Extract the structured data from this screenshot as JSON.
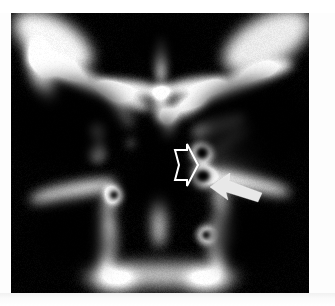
{
  "figure": {
    "modality": "CT",
    "plane": "coronal",
    "region": "paranasal sinuses and skull base",
    "background_color": "#ffffff",
    "image_background_color": "#000000",
    "bone_color": "#ffffff",
    "annotation_color": "#ffffff",
    "frame": {
      "x": 11,
      "y": 13,
      "width": 298,
      "height": 280
    }
  },
  "annotations": [
    {
      "id": "open-arrow",
      "type": "open-arrow",
      "style": "hollow white outline",
      "direction": "right",
      "color": "#ffffff",
      "outline_width": 2,
      "x": 152,
      "y": 131,
      "width": 35,
      "height": 42,
      "points": "12,6 24,6 24,0 35,21 24,42 24,36 12,36 16,21"
    },
    {
      "id": "solid-arrow",
      "type": "solid-arrow",
      "style": "filled white block arrow",
      "direction": "upper-left",
      "color": "#e8e8e8",
      "x": 199,
      "y": 158,
      "width": 54,
      "height": 31,
      "points": "0,16 20,2 19,10 52,22 48,31 16,21 18,29"
    }
  ],
  "anatomy": {
    "structures": [
      {
        "name": "left-orbital-roof",
        "label": "orbital roof (left)"
      },
      {
        "name": "right-orbital-roof",
        "label": "orbital roof (right)"
      },
      {
        "name": "crista-galli",
        "label": "midline crest / nasal septum superior"
      },
      {
        "name": "ethmoid-air-cells",
        "label": "ethmoid air cells"
      },
      {
        "name": "sphenoid-sinus",
        "label": "sphenoid sinus"
      },
      {
        "name": "pterygoid-plates",
        "label": "pterygoid plates"
      },
      {
        "name": "hard-palate",
        "label": "hard palate / maxillary alveolus"
      },
      {
        "name": "foramen-rotundum-ring",
        "label": "small cortical ring (foramen)"
      },
      {
        "name": "figure-eight-ossicle",
        "label": "paired ring opacity lateral to midline"
      }
    ]
  },
  "chart_data": {
    "type": "heatmap",
    "title": "",
    "xlabel": "",
    "ylabel": "",
    "window": "bone",
    "grid": false,
    "legend": "none",
    "blobs": [
      {
        "name": "left-frontal-orbital-bone",
        "cx": 42,
        "cy": 28,
        "rx": 44,
        "ry": 22,
        "rot": 32,
        "intensity": 0.97,
        "blur": 7
      },
      {
        "name": "left-orbital-rim-bar",
        "cx": 78,
        "cy": 70,
        "rx": 66,
        "ry": 9,
        "rot": 23,
        "intensity": 1.0,
        "blur": 5
      },
      {
        "name": "left-orbital-roof-ridge",
        "cx": 30,
        "cy": 60,
        "rx": 30,
        "ry": 10,
        "rot": 70,
        "intensity": 0.95,
        "blur": 6
      },
      {
        "name": "right-frontal-orbital-bone",
        "cx": 256,
        "cy": 28,
        "rx": 48,
        "ry": 24,
        "rot": -30,
        "intensity": 0.92,
        "blur": 7
      },
      {
        "name": "right-orbital-rim-bar",
        "cx": 222,
        "cy": 72,
        "rx": 64,
        "ry": 9,
        "rot": -20,
        "intensity": 1.0,
        "blur": 5
      },
      {
        "name": "crista-galli-spike",
        "cx": 150,
        "cy": 48,
        "rx": 5,
        "ry": 22,
        "rot": 0,
        "intensity": 1.0,
        "blur": 4
      },
      {
        "name": "cribriform-plate-left",
        "cx": 122,
        "cy": 75,
        "rx": 34,
        "ry": 7,
        "rot": 8,
        "intensity": 0.98,
        "blur": 4
      },
      {
        "name": "cribriform-plate-right",
        "cx": 180,
        "cy": 73,
        "rx": 34,
        "ry": 7,
        "rot": -10,
        "intensity": 0.98,
        "blur": 4
      },
      {
        "name": "nasal-septum-upper",
        "cx": 150,
        "cy": 92,
        "rx": 7,
        "ry": 18,
        "rot": 0,
        "intensity": 0.9,
        "blur": 5
      },
      {
        "name": "ethmoid-strand-left",
        "cx": 108,
        "cy": 96,
        "rx": 22,
        "ry": 5,
        "rot": 55,
        "intensity": 0.7,
        "blur": 6
      },
      {
        "name": "ethmoid-dot-a",
        "cx": 86,
        "cy": 118,
        "rx": 7,
        "ry": 8,
        "rot": 0,
        "intensity": 0.95,
        "blur": 4
      },
      {
        "name": "ethmoid-dot-b",
        "cx": 86,
        "cy": 140,
        "rx": 8,
        "ry": 9,
        "rot": 0,
        "intensity": 0.9,
        "blur": 4
      },
      {
        "name": "ethmoid-dot-c",
        "cx": 88,
        "cy": 129,
        "rx": 4,
        "ry": 8,
        "rot": 0,
        "intensity": 0.55,
        "blur": 4
      },
      {
        "name": "small-dot-left",
        "cx": 120,
        "cy": 130,
        "rx": 4,
        "ry": 4,
        "rot": 0,
        "intensity": 0.6,
        "blur": 4
      },
      {
        "name": "sphenoid-midline-strut",
        "cx": 158,
        "cy": 110,
        "rx": 6,
        "ry": 16,
        "rot": 10,
        "intensity": 0.8,
        "blur": 5
      },
      {
        "name": "planum-sphenoidale",
        "cx": 172,
        "cy": 98,
        "rx": 26,
        "ry": 6,
        "rot": -22,
        "intensity": 0.85,
        "blur": 5
      },
      {
        "name": "ring-eight-upper",
        "cx": 191,
        "cy": 140,
        "rx": 12,
        "ry": 11,
        "rot": 0,
        "intensity": 0.95,
        "blur": 3,
        "hollow": true,
        "hole_rx": 6,
        "hole_ry": 6
      },
      {
        "name": "ring-eight-lower",
        "cx": 192,
        "cy": 163,
        "rx": 13,
        "ry": 12,
        "rot": 0,
        "intensity": 0.95,
        "blur": 3,
        "hollow": true,
        "hole_rx": 7,
        "hole_ry": 6
      },
      {
        "name": "lateral-bar-right",
        "cx": 208,
        "cy": 112,
        "rx": 28,
        "ry": 7,
        "rot": -18,
        "intensity": 0.88,
        "blur": 5
      },
      {
        "name": "lateral-bar-right-2",
        "cx": 222,
        "cy": 124,
        "rx": 18,
        "ry": 6,
        "rot": -35,
        "intensity": 0.7,
        "blur": 6
      },
      {
        "name": "soft-haze-right",
        "cx": 214,
        "cy": 150,
        "rx": 26,
        "ry": 26,
        "rot": 0,
        "intensity": 0.3,
        "blur": 14
      },
      {
        "name": "pterygoid-left-arc",
        "cx": 62,
        "cy": 178,
        "rx": 44,
        "ry": 8,
        "rot": -12,
        "intensity": 0.9,
        "blur": 6
      },
      {
        "name": "pterygoid-left-vert",
        "cx": 96,
        "cy": 200,
        "rx": 7,
        "ry": 30,
        "rot": 12,
        "intensity": 0.75,
        "blur": 6
      },
      {
        "name": "foramen-ring-left",
        "cx": 103,
        "cy": 182,
        "rx": 9,
        "ry": 9,
        "rot": 0,
        "intensity": 0.95,
        "blur": 3,
        "hollow": true,
        "hole_rx": 4,
        "hole_ry": 4
      },
      {
        "name": "pterygoid-right-arc",
        "cx": 238,
        "cy": 170,
        "rx": 42,
        "ry": 8,
        "rot": 14,
        "intensity": 0.9,
        "blur": 6
      },
      {
        "name": "pterygoid-right-vert",
        "cx": 212,
        "cy": 200,
        "rx": 7,
        "ry": 32,
        "rot": -10,
        "intensity": 0.75,
        "blur": 6
      },
      {
        "name": "foramen-ring-right",
        "cx": 195,
        "cy": 222,
        "rx": 9,
        "ry": 9,
        "rot": 0,
        "intensity": 0.95,
        "blur": 3,
        "hollow": true,
        "hole_rx": 4,
        "hole_ry": 4
      },
      {
        "name": "vomer-midline",
        "cx": 148,
        "cy": 208,
        "rx": 7,
        "ry": 26,
        "rot": 0,
        "intensity": 0.78,
        "blur": 6
      },
      {
        "name": "maxilla-left-wall",
        "cx": 96,
        "cy": 232,
        "rx": 9,
        "ry": 26,
        "rot": 6,
        "intensity": 0.8,
        "blur": 6
      },
      {
        "name": "maxilla-right-wall",
        "cx": 206,
        "cy": 232,
        "rx": 9,
        "ry": 26,
        "rot": -6,
        "intensity": 0.8,
        "blur": 6
      },
      {
        "name": "hard-palate-bar",
        "cx": 150,
        "cy": 262,
        "rx": 78,
        "ry": 11,
        "rot": 0,
        "intensity": 0.82,
        "blur": 8
      },
      {
        "name": "alveolus-left",
        "cx": 104,
        "cy": 268,
        "rx": 20,
        "ry": 12,
        "rot": 0,
        "intensity": 0.7,
        "blur": 8
      },
      {
        "name": "alveolus-right",
        "cx": 196,
        "cy": 268,
        "rx": 20,
        "ry": 12,
        "rot": 0,
        "intensity": 0.7,
        "blur": 8
      },
      {
        "name": "right-orbit-dot",
        "cx": 256,
        "cy": 56,
        "rx": 4,
        "ry": 4,
        "rot": 0,
        "intensity": 0.85,
        "blur": 3
      },
      {
        "name": "left-orbit-faint-1",
        "cx": 58,
        "cy": 66,
        "rx": 10,
        "ry": 4,
        "rot": 0,
        "intensity": 0.18,
        "blur": 6
      },
      {
        "name": "left-orbit-faint-2",
        "cx": 46,
        "cy": 70,
        "rx": 8,
        "ry": 3,
        "rot": 0,
        "intensity": 0.15,
        "blur": 6
      }
    ]
  }
}
